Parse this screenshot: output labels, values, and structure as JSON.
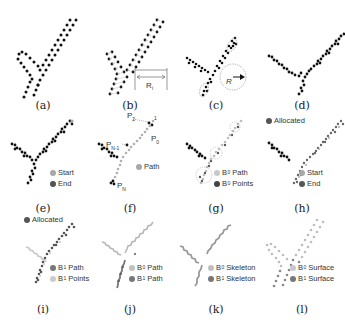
{
  "figure": {
    "panels": [
      {
        "id": "a",
        "caption": "(a)"
      },
      {
        "id": "b",
        "caption": "(b)",
        "annotation": "R",
        "annotation_sub": "i"
      },
      {
        "id": "c",
        "caption": "(c)",
        "annotation": "R"
      },
      {
        "id": "d",
        "caption": "(d)"
      },
      {
        "id": "e",
        "caption": "(e)",
        "legend": [
          {
            "label": "Start",
            "sub": "",
            "color": "#a8a8a8"
          },
          {
            "label": "End",
            "sub": "",
            "color": "#555555"
          }
        ]
      },
      {
        "id": "f",
        "caption": "(f)",
        "point_labels": {
          "p2": "P",
          "p2_sub": "2",
          "p1": "P",
          "p1_sub": "1",
          "p0": "P",
          "p0_sub": "0",
          "pn1": "P",
          "pn1_sub": "N-1",
          "pn": "P",
          "pn_sub": "N"
        },
        "legend": [
          {
            "label": "Path",
            "sub": "",
            "color": "#a8a8a8"
          }
        ]
      },
      {
        "id": "g",
        "caption": "(g)",
        "legend": [
          {
            "label": "B",
            "sub": "0",
            "suffix": "Path",
            "color": "#c8c8c8"
          },
          {
            "label": "B",
            "sub": "0",
            "suffix": "Points",
            "color": "#444444"
          }
        ]
      },
      {
        "id": "h",
        "caption": "(h)",
        "top_legend": {
          "label": "Allocated",
          "color": "#555555"
        },
        "legend": [
          {
            "label": "Start",
            "sub": "",
            "color": "#a8a8a8"
          },
          {
            "label": "End",
            "sub": "",
            "color": "#555555"
          }
        ]
      },
      {
        "id": "i",
        "caption": "(i)",
        "top_legend": {
          "label": "Allocated",
          "color": "#555555"
        },
        "legend": [
          {
            "label": "B",
            "sub": "1",
            "suffix": "Path",
            "color": "#777777"
          },
          {
            "label": "B",
            "sub": "1",
            "suffix": "Points",
            "color": "#cccccc"
          }
        ]
      },
      {
        "id": "j",
        "caption": "(j)",
        "legend": [
          {
            "label": "B",
            "sub": "0",
            "suffix": "Path",
            "color": "#c0c0c0"
          },
          {
            "label": "B",
            "sub": "1",
            "suffix": "Path",
            "color": "#777777"
          }
        ]
      },
      {
        "id": "k",
        "caption": "(k)",
        "legend": [
          {
            "label": "B",
            "sub": "0",
            "suffix": "Skeleton",
            "color": "#c0c0c0"
          },
          {
            "label": "B",
            "sub": "1",
            "suffix": "Skeleton",
            "color": "#777777"
          }
        ]
      },
      {
        "id": "l",
        "caption": "(l)",
        "legend": [
          {
            "label": "B",
            "sub": "0",
            "suffix": "Surface",
            "color": "#c8c8c8"
          },
          {
            "label": "B",
            "sub": "1",
            "suffix": "Surface",
            "color": "#777777"
          }
        ]
      }
    ]
  }
}
